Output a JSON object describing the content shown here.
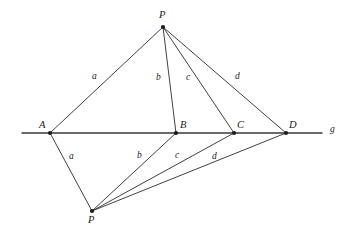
{
  "figure": {
    "kind": "geometry-diagram",
    "background_color": "#ffffff",
    "stroke_color": "#2b2b2b",
    "baseline_color": "#3a3a3a"
  },
  "line": {
    "name": "g",
    "label": "g",
    "label_pos": {
      "x": 330,
      "y": 125
    },
    "start": {
      "x": 22,
      "y": 133
    },
    "end": {
      "x": 322,
      "y": 133
    }
  },
  "points": [
    {
      "id": "P-top",
      "label": "P",
      "x": 163,
      "y": 27,
      "label_pos": {
        "x": 159,
        "y": 10
      }
    },
    {
      "id": "A",
      "label": "A",
      "x": 50,
      "y": 133,
      "label_pos": {
        "x": 39,
        "y": 120
      }
    },
    {
      "id": "B",
      "label": "B",
      "x": 176,
      "y": 133,
      "label_pos": {
        "x": 180,
        "y": 120
      }
    },
    {
      "id": "C",
      "label": "C",
      "x": 234,
      "y": 133,
      "label_pos": {
        "x": 237,
        "y": 120
      }
    },
    {
      "id": "D",
      "label": "D",
      "x": 286,
      "y": 133,
      "label_pos": {
        "x": 289,
        "y": 120
      }
    },
    {
      "id": "P-bottom",
      "label": "P",
      "x": 92,
      "y": 211,
      "label_pos": {
        "x": 88,
        "y": 215
      }
    }
  ],
  "segments": [
    {
      "id": "seg-top-a",
      "from": "P-top",
      "to": "A",
      "label": "a",
      "label_pos": {
        "x": 92,
        "y": 72
      }
    },
    {
      "id": "seg-top-b",
      "from": "P-top",
      "to": "B",
      "label": "b",
      "label_pos": {
        "x": 156,
        "y": 73
      }
    },
    {
      "id": "seg-top-c",
      "from": "P-top",
      "to": "C",
      "label": "c",
      "label_pos": {
        "x": 186,
        "y": 73
      }
    },
    {
      "id": "seg-top-d",
      "from": "P-top",
      "to": "D",
      "label": "d",
      "label_pos": {
        "x": 235,
        "y": 72
      }
    },
    {
      "id": "seg-bot-a",
      "from": "P-bottom",
      "to": "A",
      "label": "a",
      "label_pos": {
        "x": 69,
        "y": 152
      }
    },
    {
      "id": "seg-bot-b",
      "from": "P-bottom",
      "to": "B",
      "label": "b",
      "label_pos": {
        "x": 137,
        "y": 151
      }
    },
    {
      "id": "seg-bot-c",
      "from": "P-bottom",
      "to": "C",
      "label": "c",
      "label_pos": {
        "x": 175,
        "y": 151
      }
    },
    {
      "id": "seg-bot-d",
      "from": "P-bottom",
      "to": "D",
      "label": "d",
      "label_pos": {
        "x": 212,
        "y": 152
      }
    }
  ],
  "labels": {
    "point_P_top": "P",
    "point_A": "A",
    "point_B": "B",
    "point_C": "C",
    "point_D": "D",
    "point_P_bottom": "P",
    "line_g": "g",
    "seg_top_a": "a",
    "seg_top_b": "b",
    "seg_top_c": "c",
    "seg_top_d": "d",
    "seg_bot_a": "a",
    "seg_bot_b": "b",
    "seg_bot_c": "c",
    "seg_bot_d": "d"
  }
}
